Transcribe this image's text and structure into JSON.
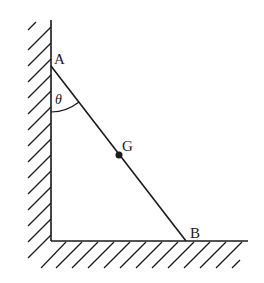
{
  "diagram": {
    "type": "ladder-against-wall",
    "labels": {
      "top_point": "A",
      "bottom_point": "B",
      "center_of_gravity": "G",
      "angle": "θ"
    },
    "points": {
      "A": [
        51,
        66
      ],
      "B": [
        186,
        241
      ],
      "G": [
        119,
        155
      ],
      "corner": [
        51,
        241
      ]
    },
    "wall": {
      "x": 51,
      "y_top": 20,
      "y_bottom": 241
    },
    "floor": {
      "y": 241,
      "x_left": 51,
      "x_right": 248
    },
    "colors": {
      "stroke": "#1a1a1a",
      "background": "#ffffff"
    }
  }
}
